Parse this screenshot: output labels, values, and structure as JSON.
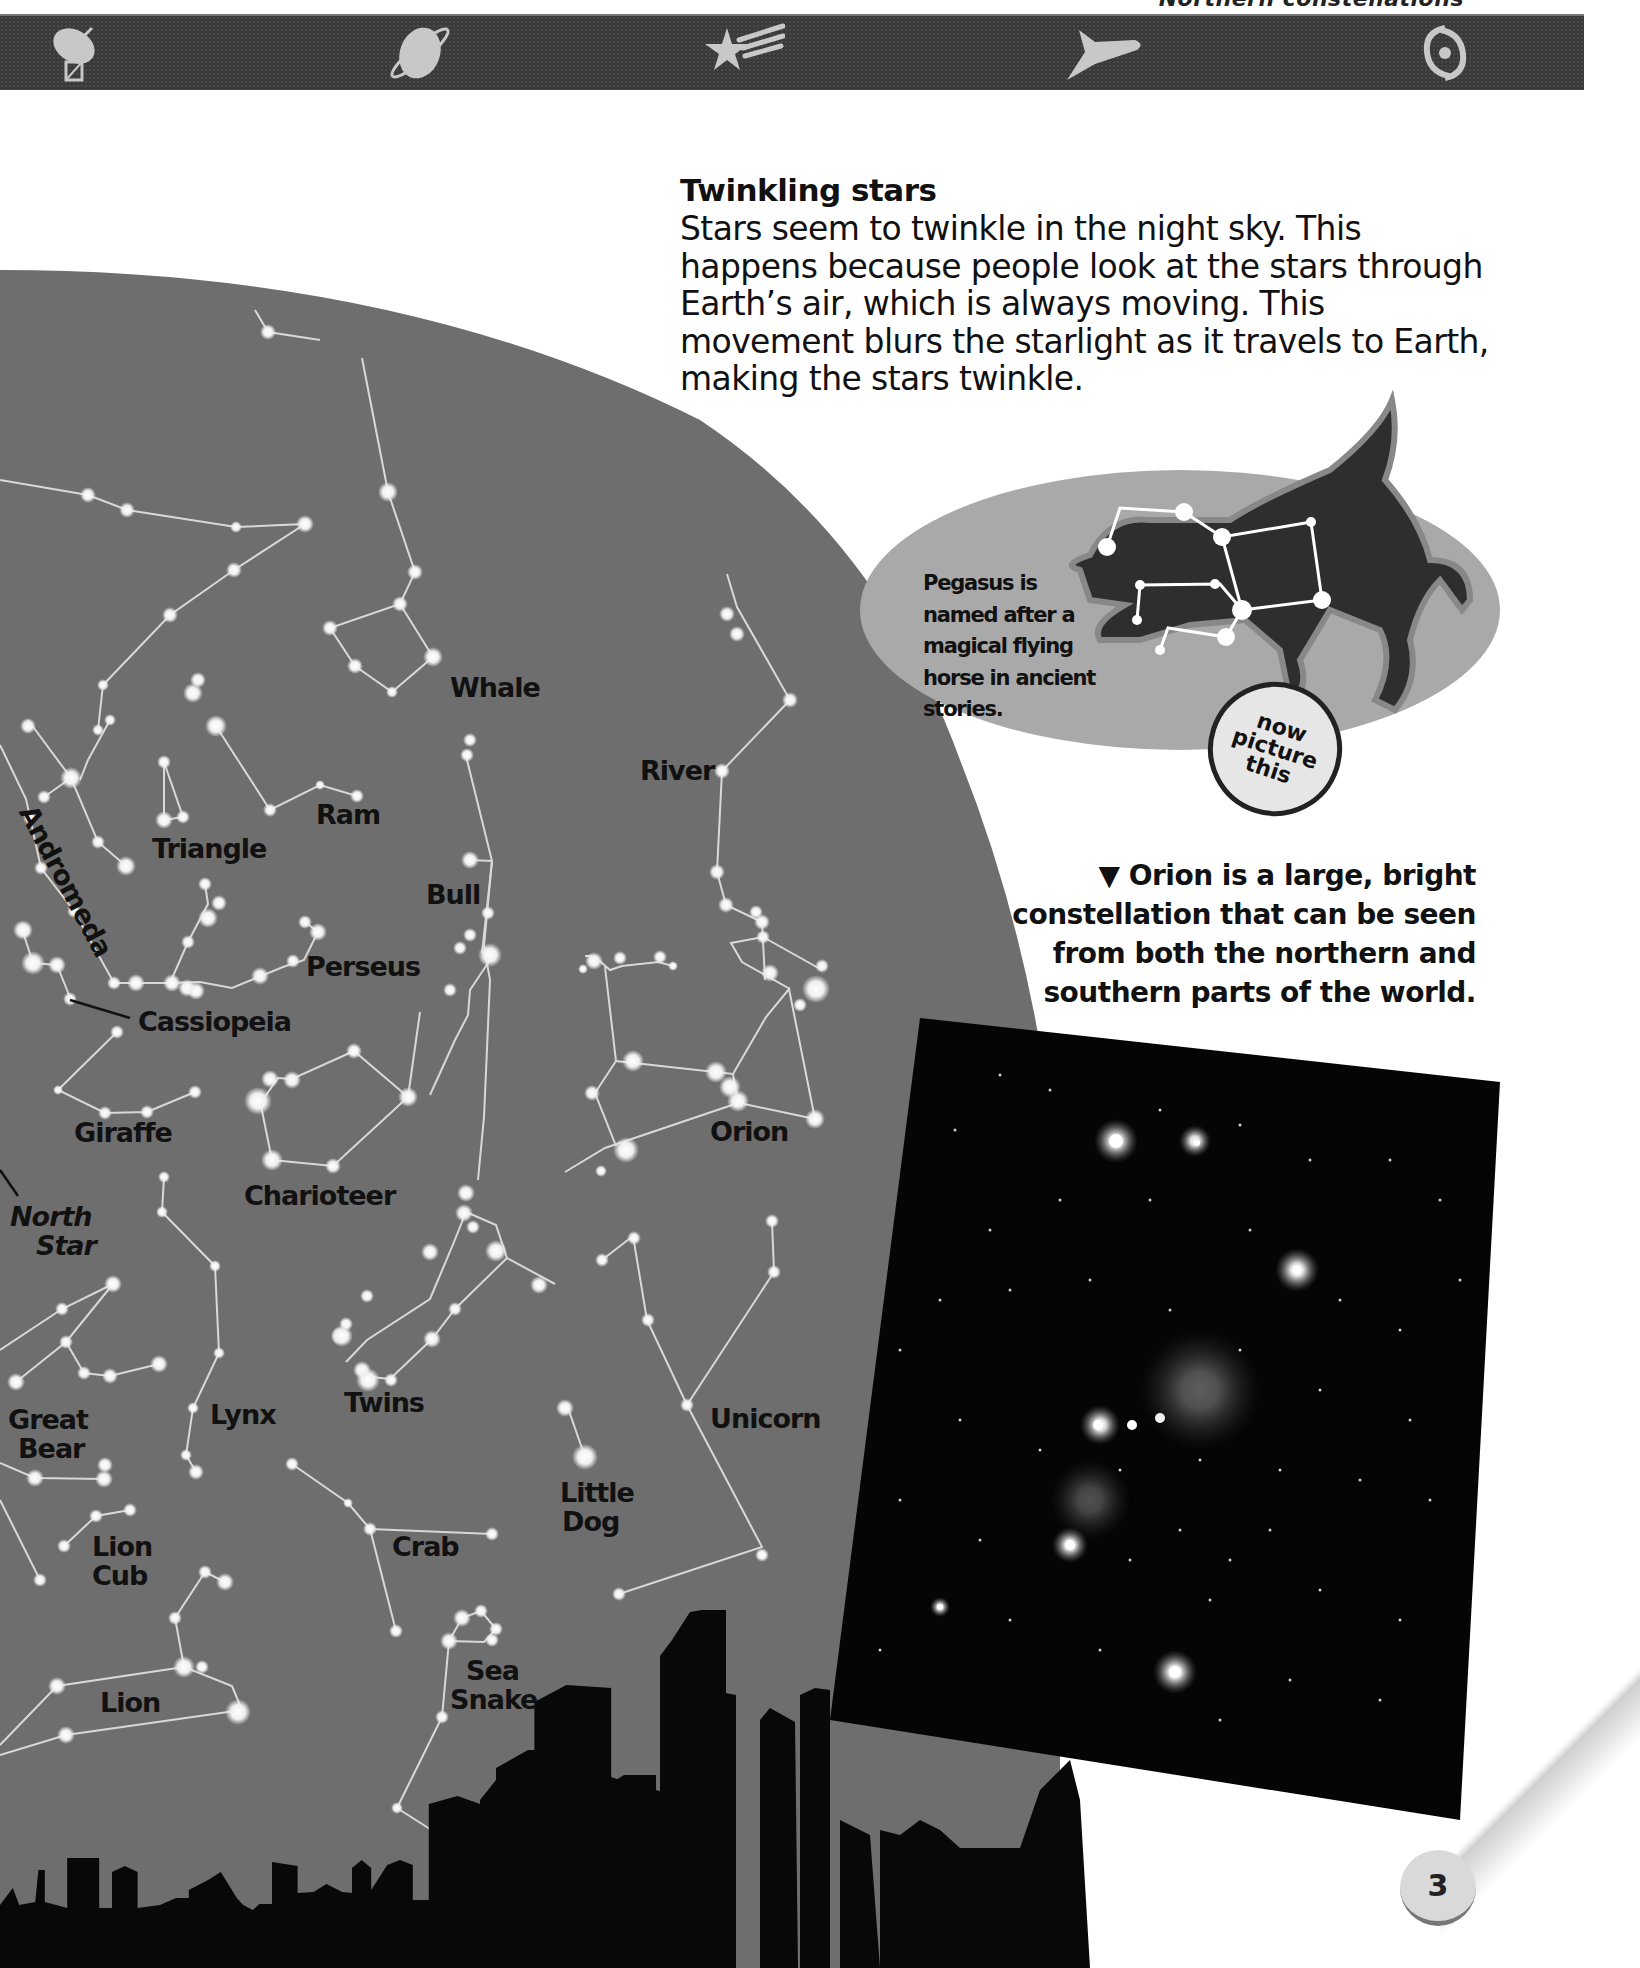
{
  "header": {
    "caption": "Northern constellations",
    "icons": [
      {
        "name": "radio-telescope-icon",
        "x": 40
      },
      {
        "name": "saturn-icon",
        "x": 380
      },
      {
        "name": "shooting-star-icon",
        "x": 705
      },
      {
        "name": "space-shuttle-icon",
        "x": 1065
      },
      {
        "name": "galaxy-icon",
        "x": 1405
      }
    ],
    "bar_color": "#3a3a3a",
    "icon_color": "#c8c8c8"
  },
  "twinkling": {
    "title": "Twinkling stars",
    "body": "Stars seem to twinkle in the night sky. This happens because people look at the stars through Earth’s air, which is always moving. This movement blurs the starlight as it travels to Earth, making the stars twinkle."
  },
  "pegasus": {
    "text": "Pegasus is named after a magical flying horse in ancient stories.",
    "badge": {
      "line1": "now",
      "line2": "picture",
      "line3": "this"
    }
  },
  "orion_caption": {
    "marker": "▼",
    "text": "Orion is a large, bright constellation that can be seen from both the northern and southern parts of the world."
  },
  "map": {
    "sky_color": "#6e6e6e",
    "star_color": "#f4f4f4",
    "line_color": "#dcdcdc",
    "labels": [
      {
        "id": "whale",
        "text": "Whale",
        "x": 450,
        "y": 673
      },
      {
        "id": "river",
        "text": "River",
        "x": 640,
        "y": 756
      },
      {
        "id": "andromeda",
        "text": "Andromeda",
        "x": 40,
        "y": 800,
        "rotate": 62
      },
      {
        "id": "triangle",
        "text": "Triangle",
        "x": 152,
        "y": 834
      },
      {
        "id": "ram",
        "text": "Ram",
        "x": 316,
        "y": 800
      },
      {
        "id": "bull",
        "text": "Bull",
        "x": 426,
        "y": 880
      },
      {
        "id": "perseus",
        "text": "Perseus",
        "x": 306,
        "y": 952
      },
      {
        "id": "cassiopeia",
        "text": "Cassiopeia",
        "x": 138,
        "y": 1007
      },
      {
        "id": "giraffe",
        "text": "Giraffe",
        "x": 74,
        "y": 1118
      },
      {
        "id": "orion",
        "text": "Orion",
        "x": 710,
        "y": 1117
      },
      {
        "id": "charioteer",
        "text": "Charioteer",
        "x": 244,
        "y": 1181
      },
      {
        "id": "north-star",
        "text": "North\nStar",
        "x": 10,
        "y": 1202,
        "italic": true
      },
      {
        "id": "great-bear",
        "text": "Great\nBear",
        "x": 8,
        "y": 1405
      },
      {
        "id": "lynx",
        "text": "Lynx",
        "x": 200,
        "y": 1400
      },
      {
        "id": "twins",
        "text": "Twins",
        "x": 344,
        "y": 1388
      },
      {
        "id": "unicorn",
        "text": "Unicorn",
        "x": 710,
        "y": 1404
      },
      {
        "id": "little-dog",
        "text": "Little\nDog",
        "x": 560,
        "y": 1478
      },
      {
        "id": "lion-cub",
        "text": "Lion\nCub",
        "x": 92,
        "y": 1532
      },
      {
        "id": "crab",
        "text": "Crab",
        "x": 392,
        "y": 1532
      },
      {
        "id": "sea-snake",
        "text": "Sea\nSnake",
        "x": 450,
        "y": 1656
      },
      {
        "id": "lion",
        "text": "Lion",
        "x": 100,
        "y": 1688
      }
    ]
  },
  "photo": {
    "alt": "Orion constellation photograph",
    "bg": "#050505"
  },
  "page_number": "3"
}
